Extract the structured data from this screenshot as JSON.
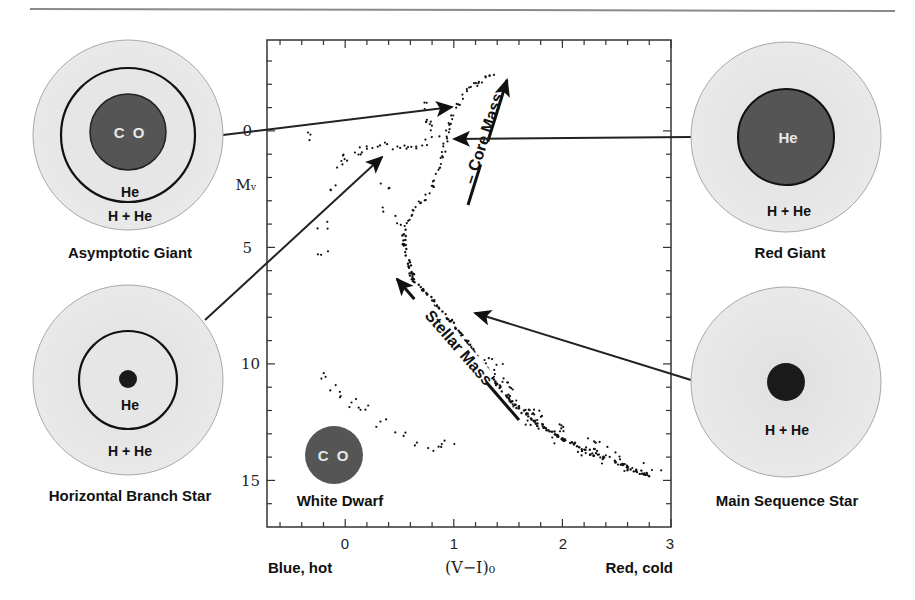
{
  "colors": {
    "envelope": "#e6e6e6",
    "envelope_edge": "#a8a8a8",
    "core_dark": "#555555",
    "core_black": "#1a1a1a",
    "ring": "#111111",
    "arrow": "#222222",
    "rule": "#8a8a8a"
  },
  "stars": {
    "asymptotic_giant": {
      "name": "Asymptotic Giant",
      "core": "C O",
      "shell": "He",
      "envelope": "H + He"
    },
    "horizontal_branch": {
      "name": "Horizontal Branch Star",
      "shell": "He",
      "envelope": "H + He"
    },
    "red_giant": {
      "name": "Red Giant",
      "core": "He",
      "envelope": "H + He"
    },
    "main_sequence": {
      "name": "Main Sequence Star",
      "envelope": "H + He"
    },
    "white_dwarf": {
      "name": "White Dwarf",
      "core": "C O"
    }
  },
  "annotations": {
    "core_mass": "– Core Mass",
    "stellar_mass": "Stellar Mass"
  },
  "chart_data": {
    "type": "scatter",
    "title": "",
    "xlabel": "(V−I)₀",
    "ylabel": "Mᵥ",
    "x_left_label": "Blue, hot",
    "x_right_label": "Red, cold",
    "xlim": [
      -0.72,
      3.0
    ],
    "ylim": [
      17.0,
      -3.9
    ],
    "y_inverted": true,
    "x_ticks": [
      "0",
      "1",
      "2",
      "3"
    ],
    "y_ticks": [
      "0",
      "5",
      "10",
      "15"
    ],
    "grid": false,
    "series": [
      {
        "name": "Red Giant Branch",
        "points": [
          [
            0.55,
            4.0
          ],
          [
            0.65,
            3.3
          ],
          [
            0.78,
            2.6
          ],
          [
            0.86,
            1.8
          ],
          [
            0.9,
            1.0
          ],
          [
            0.93,
            0.3
          ],
          [
            0.97,
            -0.5
          ],
          [
            1.05,
            -1.3
          ],
          [
            1.15,
            -1.9
          ],
          [
            1.3,
            -2.3
          ],
          [
            1.4,
            -2.5
          ]
        ]
      },
      {
        "name": "Horizontal Branch",
        "points": [
          [
            -0.1,
            1.5
          ],
          [
            0.0,
            1.2
          ],
          [
            0.1,
            0.9
          ],
          [
            0.2,
            0.75
          ],
          [
            0.35,
            0.65
          ],
          [
            0.5,
            0.65
          ],
          [
            0.65,
            0.6
          ],
          [
            0.75,
            0.5
          ]
        ]
      },
      {
        "name": "Main Sequence",
        "points": [
          [
            0.54,
            4.1
          ],
          [
            0.55,
            5.0
          ],
          [
            0.62,
            6.3
          ],
          [
            0.8,
            7.3
          ],
          [
            1.0,
            8.3
          ],
          [
            1.2,
            9.6
          ],
          [
            1.4,
            10.9
          ],
          [
            1.55,
            11.7
          ],
          [
            1.75,
            12.5
          ],
          [
            2.0,
            13.2
          ],
          [
            2.3,
            13.9
          ],
          [
            2.8,
            14.8
          ]
        ]
      },
      {
        "name": "White Dwarf Sequence",
        "points": [
          [
            -0.2,
            10.5
          ],
          [
            -0.1,
            11.0
          ],
          [
            0.0,
            11.5
          ],
          [
            0.1,
            11.7
          ],
          [
            0.2,
            12.0
          ],
          [
            0.35,
            12.5
          ],
          [
            0.5,
            13.0
          ],
          [
            0.7,
            13.4
          ],
          [
            0.85,
            13.6
          ],
          [
            0.95,
            13.4
          ]
        ]
      },
      {
        "name": "AGB / scattered",
        "points": [
          [
            0.7,
            -1.0
          ],
          [
            0.8,
            -0.4
          ],
          [
            0.85,
            0.1
          ],
          [
            0.75,
            -0.3
          ],
          [
            -0.3,
            0.2
          ],
          [
            -0.15,
            2.5
          ],
          [
            -0.2,
            4.0
          ],
          [
            -0.2,
            5.2
          ],
          [
            0.35,
            2.3
          ],
          [
            0.4,
            3.5
          ],
          [
            0.5,
            3.9
          ]
        ]
      }
    ]
  }
}
